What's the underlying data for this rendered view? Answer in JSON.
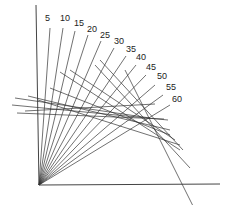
{
  "diagram": {
    "origin": [
      39,
      185
    ],
    "axes": {
      "vertical": {
        "x1": 36,
        "y1": 5,
        "x2": 39,
        "y2": 185
      },
      "horizontal": {
        "x1": 39,
        "y1": 185,
        "x2": 220,
        "y2": 184
      }
    },
    "ray_color": "#333333",
    "rays": [
      {
        "label": "5",
        "end": [
          50,
          28
        ],
        "label_pos": [
          45,
          21
        ]
      },
      {
        "label": "10",
        "end": [
          63,
          28
        ],
        "label_pos": [
          60,
          21
        ]
      },
      {
        "label": "15",
        "end": [
          75,
          31
        ],
        "label_pos": [
          74,
          26
        ]
      },
      {
        "label": "20",
        "end": [
          88,
          35
        ],
        "label_pos": [
          87,
          32
        ]
      },
      {
        "label": "25",
        "end": [
          101,
          41
        ],
        "label_pos": [
          100,
          38
        ]
      },
      {
        "label": "30",
        "end": [
          114,
          48
        ],
        "label_pos": [
          114,
          44
        ]
      },
      {
        "label": "35",
        "end": [
          126,
          56
        ],
        "label_pos": [
          126,
          52
        ]
      },
      {
        "label": "40",
        "end": [
          136,
          65
        ],
        "label_pos": [
          136,
          60
        ]
      },
      {
        "label": "45",
        "end": [
          146,
          75
        ],
        "label_pos": [
          146,
          70
        ]
      },
      {
        "label": "50",
        "end": [
          155,
          85
        ],
        "label_pos": [
          157,
          79
        ]
      },
      {
        "label": "55",
        "end": [
          163,
          95
        ],
        "label_pos": [
          166,
          90
        ]
      },
      {
        "label": "60",
        "end": [
          170,
          105
        ],
        "label_pos": [
          172,
          102
        ]
      }
    ],
    "cross_lines": [
      [
        [
          15,
          98
        ],
        [
          150,
          118
        ]
      ],
      [
        [
          12,
          105
        ],
        [
          168,
          120
        ]
      ],
      [
        [
          17,
          113
        ],
        [
          164,
          119
        ]
      ],
      [
        [
          25,
          111
        ],
        [
          155,
          104
        ]
      ],
      [
        [
          28,
          96
        ],
        [
          170,
          130
        ]
      ],
      [
        [
          50,
          88
        ],
        [
          170,
          135
        ]
      ],
      [
        [
          60,
          72
        ],
        [
          180,
          150
        ]
      ],
      [
        [
          70,
          70
        ],
        [
          175,
          140
        ]
      ],
      [
        [
          100,
          60
        ],
        [
          183,
          150
        ]
      ],
      [
        [
          95,
          65
        ],
        [
          190,
          168
        ]
      ],
      [
        [
          125,
          70
        ],
        [
          195,
          210
        ]
      ],
      [
        [
          38,
          100
        ],
        [
          180,
          145
        ]
      ]
    ]
  }
}
